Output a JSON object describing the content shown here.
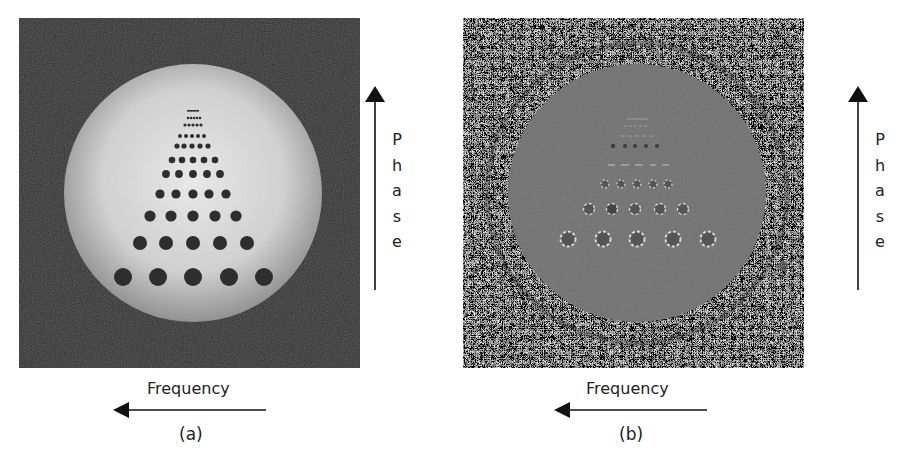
{
  "figure": {
    "panels": [
      {
        "id": "a",
        "caption": "(a)",
        "description": "Magnitude image of a phantom with a triangular array of dark circular holes",
        "frequency_label": "Frequency",
        "phase_label": [
          "P",
          "h",
          "a",
          "s",
          "e"
        ],
        "colors": {
          "background": "#2a2a2a",
          "disk_center": "#eaeaea",
          "disk_edge": "#9a9a9a",
          "holes": "#2b2b2b"
        }
      },
      {
        "id": "b",
        "caption": "(b)",
        "description": "Phase image of the same phantom with noisy background and speckled hole pattern",
        "frequency_label": "Frequency",
        "phase_label": [
          "P",
          "h",
          "a",
          "s",
          "e"
        ],
        "colors": {
          "background_noise": "#7a7a7a",
          "disk": "#6e6e6e"
        }
      }
    ],
    "axes": {
      "frequency_direction": "left",
      "phase_direction": "up"
    },
    "hole_rows": {
      "count": 11,
      "holes_per_row": 5
    }
  }
}
